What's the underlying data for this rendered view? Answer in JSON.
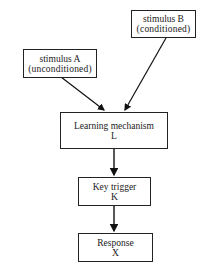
{
  "diagram": {
    "nodes": [
      {
        "id": "stimulus_b",
        "line1": "stimulus B",
        "line2": "(conditioned)"
      },
      {
        "id": "stimulus_a",
        "line1": "stimulus A",
        "line2": "(unconditioned)"
      },
      {
        "id": "learning",
        "line1": "Learning mechanism",
        "line2": "L"
      },
      {
        "id": "key_trigger",
        "line1": "Key trigger",
        "line2": "K"
      },
      {
        "id": "response",
        "line1": "Response",
        "line2": "X"
      }
    ],
    "edges": [
      {
        "from": "stimulus_a",
        "to": "learning"
      },
      {
        "from": "stimulus_b",
        "to": "learning"
      },
      {
        "from": "learning",
        "to": "key_trigger"
      },
      {
        "from": "key_trigger",
        "to": "response"
      }
    ]
  }
}
